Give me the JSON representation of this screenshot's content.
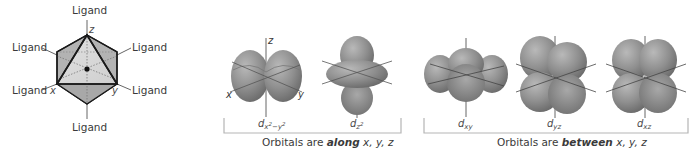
{
  "octahedron": {
    "ligand_label": "Ligand",
    "ligands": [
      "Ligand",
      "Ligand",
      "Ligand",
      "Ligand",
      "Ligand",
      "Ligand"
    ],
    "axes": {
      "x": "x",
      "y": "y",
      "z": "z"
    },
    "colors": {
      "face_dark": "#a9a9a9",
      "face_light": "#d4d4d4",
      "edge": "#1a1a1a"
    }
  },
  "orbitals": {
    "group_along": {
      "caption_prefix": "Orbitals are",
      "caption_emphasis": "along",
      "caption_suffix": "x, y, z",
      "items": [
        {
          "name": "dx2-y2",
          "base": "d",
          "subscript": "x",
          "sup1": "2",
          "mid": "−y",
          "sup2": "2",
          "axes": [
            "x",
            "y",
            "z"
          ]
        },
        {
          "name": "dz2",
          "base": "d",
          "subscript": "z",
          "sup1": "2"
        }
      ]
    },
    "group_between": {
      "caption_prefix": "Orbitals are",
      "caption_emphasis": "between",
      "caption_suffix": "x, y, z",
      "items": [
        {
          "name": "dxy",
          "base": "d",
          "subscript": "xy"
        },
        {
          "name": "dyz",
          "base": "d",
          "subscript": "yz"
        },
        {
          "name": "dxz",
          "base": "d",
          "subscript": "xz"
        }
      ]
    },
    "colors": {
      "lobe": "#8e8e8e",
      "lobe_highlight": "#b8b8b8",
      "lobe_shadow": "#6a6a6a",
      "bracket": "#b5b5b5",
      "axis": "#555555"
    }
  }
}
